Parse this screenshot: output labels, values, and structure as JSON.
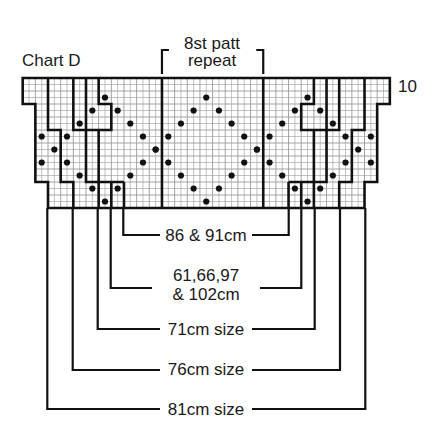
{
  "title": "Chart D",
  "repeat_label": {
    "line1": "8st patt",
    "line2": "repeat"
  },
  "row_label": "10",
  "grid": {
    "x0": 22.7,
    "y0": 78,
    "cols": 29,
    "rows": 10,
    "cell_w": 12.66,
    "cell_h": 13,
    "repeat_cols": [
      11,
      19
    ],
    "ink": "#111111",
    "minor_line": "#9a9a9a"
  },
  "dots": [
    [
      6,
      1
    ],
    [
      5,
      2
    ],
    [
      7,
      2
    ],
    [
      4,
      3
    ],
    [
      8,
      3
    ],
    [
      1,
      4
    ],
    [
      3,
      4
    ],
    [
      9,
      4
    ],
    [
      2,
      5
    ],
    [
      10,
      5
    ],
    [
      1,
      6
    ],
    [
      3,
      6
    ],
    [
      9,
      6
    ],
    [
      4,
      7
    ],
    [
      8,
      7
    ],
    [
      5,
      8
    ],
    [
      7,
      8
    ],
    [
      6,
      9
    ],
    [
      14,
      1
    ],
    [
      13,
      2
    ],
    [
      15,
      2
    ],
    [
      12,
      3
    ],
    [
      16,
      3
    ],
    [
      11,
      4
    ],
    [
      17,
      4
    ],
    [
      10,
      5
    ],
    [
      18,
      5
    ],
    [
      11,
      6
    ],
    [
      17,
      6
    ],
    [
      12,
      7
    ],
    [
      16,
      7
    ],
    [
      13,
      8
    ],
    [
      15,
      8
    ],
    [
      14,
      9
    ],
    [
      22,
      1
    ],
    [
      21,
      2
    ],
    [
      23,
      2
    ],
    [
      20,
      3
    ],
    [
      24,
      3
    ],
    [
      19,
      4
    ],
    [
      25,
      4
    ],
    [
      27,
      4
    ],
    [
      18,
      5
    ],
    [
      26,
      5
    ],
    [
      19,
      6
    ],
    [
      25,
      6
    ],
    [
      27,
      6
    ],
    [
      20,
      7
    ],
    [
      24,
      7
    ],
    [
      21,
      8
    ],
    [
      23,
      8
    ],
    [
      22,
      9
    ]
  ],
  "size_labels": [
    {
      "text": "86 & 91cm",
      "y": 235,
      "left_x": 123.3,
      "right_x": 288.7
    },
    {
      "text": "61,66,97",
      "text2": "& 102cm",
      "y": 288,
      "left_x": 110.7,
      "right_x": 301.3
    },
    {
      "text": "71cm size",
      "y": 329,
      "left_x": 97.7,
      "right_x": 314.7
    },
    {
      "text": "76cm size",
      "y": 370,
      "left_x": 72.7,
      "right_x": 340
    },
    {
      "text": "81cm size",
      "y": 409,
      "left_x": 47.3,
      "right_x": 365.3
    }
  ]
}
